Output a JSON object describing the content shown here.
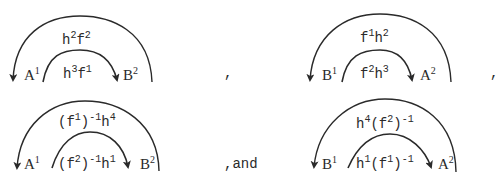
{
  "diagrams": [
    {
      "id": "d1",
      "left_node": {
        "base": "A",
        "sup": "1"
      },
      "right_node": {
        "base": "B",
        "sup": "2"
      },
      "outer_label": {
        "parts": [
          [
            "h",
            "2"
          ],
          [
            "f",
            "2"
          ]
        ]
      },
      "inner_label": {
        "parts": [
          [
            "h",
            "3"
          ],
          [
            "f",
            "1"
          ]
        ]
      },
      "outer_arrow": "points-left",
      "inner_arrow": "points-right"
    },
    {
      "id": "d2",
      "left_node": {
        "base": "B",
        "sup": "1"
      },
      "right_node": {
        "base": "A",
        "sup": "2"
      },
      "outer_label": {
        "parts": [
          [
            "f",
            "1"
          ],
          [
            "h",
            "2"
          ]
        ]
      },
      "inner_label": {
        "parts": [
          [
            "f",
            "2"
          ],
          [
            "h",
            "3"
          ]
        ]
      },
      "outer_arrow": "points-left",
      "inner_arrow": "points-right"
    },
    {
      "id": "d3",
      "left_node": {
        "base": "A",
        "sup": "1"
      },
      "right_node": {
        "base": "B",
        "sup": "2"
      },
      "outer_label_text": "(f¹)⁻¹h⁴",
      "inner_label_text": "(f²)⁻¹h¹",
      "outer_arrow": "points-left",
      "inner_arrow": "points-right"
    },
    {
      "id": "d4",
      "left_node": {
        "base": "B",
        "sup": "1"
      },
      "right_node": {
        "base": "A",
        "sup": "2"
      },
      "outer_label_text": "h⁴(f²)⁻¹",
      "inner_label_text": "h¹(f¹)⁻¹",
      "outer_arrow": "points-left",
      "inner_arrow": "points-right"
    }
  ],
  "labels": {
    "d1_left": "A",
    "d1_left_sup": "1",
    "d1_right": "B",
    "d1_right_sup": "2",
    "d1_outer_a": "h",
    "d1_outer_a_sup": "2",
    "d1_outer_b": "f",
    "d1_outer_b_sup": "2",
    "d1_inner_a": "h",
    "d1_inner_a_sup": "3",
    "d1_inner_b": "f",
    "d1_inner_b_sup": "1",
    "d2_left": "B",
    "d2_left_sup": "1",
    "d2_right": "A",
    "d2_right_sup": "2",
    "d2_outer_a": "f",
    "d2_outer_a_sup": "1",
    "d2_outer_b": "h",
    "d2_outer_b_sup": "2",
    "d2_inner_a": "f",
    "d2_inner_a_sup": "2",
    "d2_inner_b": "h",
    "d2_inner_b_sup": "3",
    "d3_left": "A",
    "d3_left_sup": "1",
    "d3_right": "B",
    "d3_right_sup": "2",
    "d3_outer_p1": "(f",
    "d3_outer_s1": "1",
    "d3_outer_p2": ")",
    "d3_outer_s2": "-1",
    "d3_outer_p3": "h",
    "d3_outer_s3": "4",
    "d3_inner_p1": "(f",
    "d3_inner_s1": "2",
    "d3_inner_p2": ")",
    "d3_inner_s2": "-1",
    "d3_inner_p3": "h",
    "d3_inner_s3": "1",
    "d4_left": "B",
    "d4_left_sup": "1",
    "d4_right": "A",
    "d4_right_sup": "2",
    "d4_outer_p1": "h",
    "d4_outer_s1": "4",
    "d4_outer_p2": "(f",
    "d4_outer_s2": "2",
    "d4_outer_p3": ")",
    "d4_outer_s3": "-1",
    "d4_inner_p1": "h",
    "d4_inner_s1": "1",
    "d4_inner_p2": "(f",
    "d4_inner_s2": "1",
    "d4_inner_p3": ")",
    "d4_inner_s3": "-1"
  },
  "separators": {
    "comma1": ",",
    "comma2": ",",
    "and_text": ",and"
  },
  "colors": {
    "ink": "#2a2a2a",
    "background": "#ffffff"
  }
}
